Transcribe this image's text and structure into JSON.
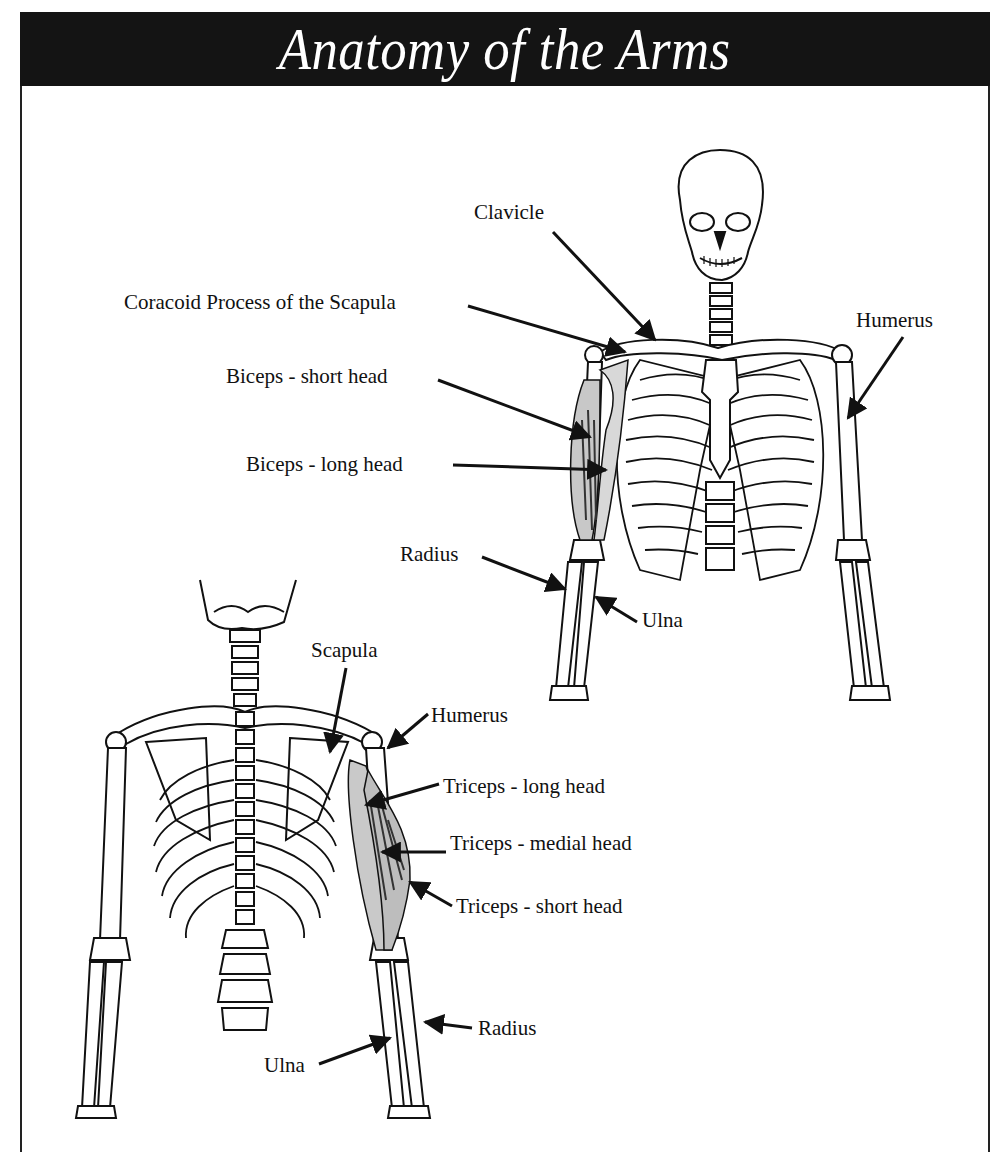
{
  "title": "Anatomy of the Arms",
  "colors": {
    "title_band": "#141414",
    "title_text": "#ffffff",
    "line": "#111111",
    "muscle_fill": "#bdbdbd"
  },
  "figures": {
    "anterior": {
      "view": "front",
      "labels": {
        "clavicle": "Clavicle",
        "coracoid": "Coracoid Process of the Scapula",
        "humerus": "Humerus",
        "biceps_short": "Biceps - short head",
        "biceps_long": "Biceps - long head",
        "radius": "Radius",
        "ulna": "Ulna"
      }
    },
    "posterior": {
      "view": "back",
      "labels": {
        "scapula": "Scapula",
        "humerus": "Humerus",
        "triceps_long": "Triceps - long head",
        "triceps_medial": "Triceps - medial head",
        "triceps_short": "Triceps - short head",
        "radius": "Radius",
        "ulna": "Ulna"
      }
    }
  }
}
